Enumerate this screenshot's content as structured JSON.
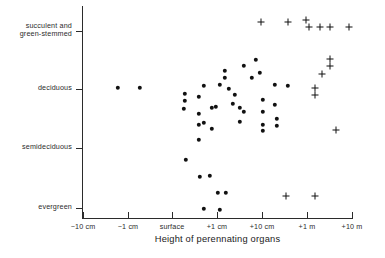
{
  "chart_data": {
    "type": "scatter",
    "title": "",
    "xlabel": "Height of perennating organs",
    "ylabel": "",
    "grid": false,
    "legend": "none",
    "x_tick_labels": [
      "−10 cm",
      "−1 cm",
      "surface",
      "+1 cm",
      "+10 cm",
      "+1 m",
      "+10 m"
    ],
    "y_tick_labels": [
      "succulent and\ngreen-stemmed",
      "deciduous",
      "semideciduous",
      "evergreen"
    ],
    "y_categories": [
      "succulent and green-stemmed",
      "deciduous",
      "semideciduous",
      "evergreen"
    ],
    "series": [
      {
        "name": "filled-circle",
        "marker": "circle",
        "color": "#111111",
        "points": [
          [
            118,
            88
          ],
          [
            140,
            88
          ],
          [
            185,
            94
          ],
          [
            185,
            101
          ],
          [
            184,
            109
          ],
          [
            199,
            97
          ],
          [
            199,
            114
          ],
          [
            199,
            125
          ],
          [
            199,
            140
          ],
          [
            204,
            86
          ],
          [
            204,
            123
          ],
          [
            212,
            108
          ],
          [
            212,
            129
          ],
          [
            216,
            107
          ],
          [
            220,
            85
          ],
          [
            225,
            71
          ],
          [
            225,
            78
          ],
          [
            229,
            89
          ],
          [
            233,
            104
          ],
          [
            235,
            95
          ],
          [
            240,
            108
          ],
          [
            240,
            122
          ],
          [
            244,
            66
          ],
          [
            244,
            112
          ],
          [
            252,
            78
          ],
          [
            256,
            60
          ],
          [
            260,
            73
          ],
          [
            263,
            100
          ],
          [
            263,
            112
          ],
          [
            263,
            125
          ],
          [
            263,
            131
          ],
          [
            275,
            85
          ],
          [
            275,
            105
          ],
          [
            277,
            119
          ],
          [
            277,
            126
          ],
          [
            288,
            86
          ],
          [
            186,
            160
          ],
          [
            200,
            177
          ],
          [
            210,
            176
          ],
          [
            204,
            209
          ],
          [
            218,
            193
          ],
          [
            226,
            193
          ],
          [
            220,
            210
          ]
        ]
      },
      {
        "name": "plus",
        "marker": "plus",
        "color": "#111111",
        "points": [
          [
            261,
            22
          ],
          [
            288,
            22
          ],
          [
            306,
            20
          ],
          [
            309,
            27
          ],
          [
            320,
            27
          ],
          [
            330,
            27
          ],
          [
            349,
            27
          ],
          [
            330,
            59
          ],
          [
            330,
            66
          ],
          [
            322,
            74
          ],
          [
            315,
            88
          ],
          [
            315,
            95
          ],
          [
            336,
            130
          ],
          [
            286,
            196
          ],
          [
            315,
            196
          ]
        ]
      }
    ]
  },
  "axes": {
    "x_ticks": [
      {
        "label": "−10 cm",
        "x": 83
      },
      {
        "label": "−1 cm",
        "x": 128
      },
      {
        "label": "surface",
        "x": 172
      },
      {
        "label": "+1 cm",
        "x": 217
      },
      {
        "label": "+10 cm",
        "x": 262
      },
      {
        "label": "+1 m",
        "x": 307
      },
      {
        "label": "+10 m",
        "x": 352
      }
    ],
    "y_ticks": [
      {
        "label": "succulent and\ngreen-stemmed",
        "y": 31
      },
      {
        "label": "deciduous",
        "y": 89
      },
      {
        "label": "semideciduous",
        "y": 148
      },
      {
        "label": "evergreen",
        "y": 208
      }
    ],
    "x_axis_title": "Height of perennating organs"
  },
  "colors": {
    "marker": "#111111",
    "axis": "#2b2b2b",
    "background": "#ffffff"
  }
}
